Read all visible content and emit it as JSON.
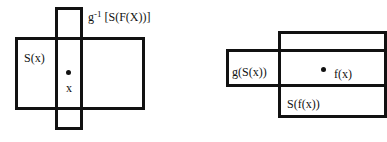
{
  "left_diagram": {
    "set_label": "S(x)",
    "point_label": "x",
    "preimage_label_base": "g",
    "preimage_label_exp": "-1",
    "preimage_label_rest": " [S(F(X))]"
  },
  "right_diagram": {
    "image_label": "g(S(x))",
    "point_label": "f(x)",
    "set_label": "S(f(x))"
  }
}
